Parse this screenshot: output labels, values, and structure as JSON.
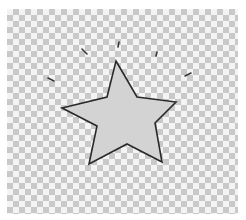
{
  "canvas": {
    "width": 246,
    "height": 220,
    "background": "transparent-checkerboard",
    "checker_light": "#f4f4f4",
    "checker_dark": "#c9c9c9"
  },
  "star": {
    "icon": "star-icon",
    "fill": "#d3d3d3",
    "stroke": "#2a2a2a",
    "points": [
      [
        116,
        61
      ],
      [
        137,
        97
      ],
      [
        176,
        102
      ],
      [
        155,
        123
      ],
      [
        162,
        162
      ],
      [
        127,
        144
      ],
      [
        89,
        164
      ],
      [
        97,
        126
      ],
      [
        62,
        108
      ],
      [
        107,
        97
      ]
    ]
  },
  "sparkles": {
    "icon": "shine-lines-icon",
    "color": "#3a3a3a",
    "count": 6
  }
}
